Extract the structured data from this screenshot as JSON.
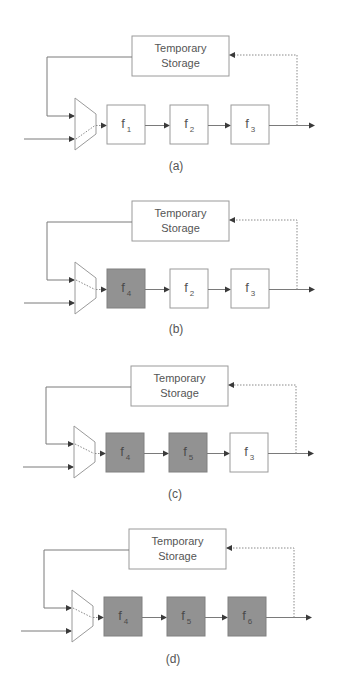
{
  "figure": {
    "panels": [
      {
        "caption": "(a)",
        "storage": {
          "line1": "Temporary",
          "line2": "Storage"
        },
        "stages": [
          {
            "name": "f",
            "sub": "1",
            "active": false
          },
          {
            "name": "f",
            "sub": "2",
            "active": false
          },
          {
            "name": "f",
            "sub": "3",
            "active": false
          }
        ]
      },
      {
        "caption": "(b)",
        "storage": {
          "line1": "Temporary",
          "line2": "Storage"
        },
        "stages": [
          {
            "name": "f",
            "sub": "4",
            "active": true
          },
          {
            "name": "f",
            "sub": "2",
            "active": false
          },
          {
            "name": "f",
            "sub": "3",
            "active": false
          }
        ]
      },
      {
        "caption": "(c)",
        "storage": {
          "line1": "Temporary",
          "line2": "Storage"
        },
        "stages": [
          {
            "name": "f",
            "sub": "4",
            "active": true
          },
          {
            "name": "f",
            "sub": "5",
            "active": true
          },
          {
            "name": "f",
            "sub": "3",
            "active": false
          }
        ]
      },
      {
        "caption": "(d)",
        "storage": {
          "line1": "Temporary",
          "line2": "Storage"
        },
        "stages": [
          {
            "name": "f",
            "sub": "4",
            "active": true
          },
          {
            "name": "f",
            "sub": "5",
            "active": true
          },
          {
            "name": "f",
            "sub": "6",
            "active": true
          }
        ]
      }
    ],
    "colors": {
      "active_stage_fill": "#929292",
      "inactive_stage_fill": "#ffffff",
      "line": "#7a7a7a"
    }
  }
}
